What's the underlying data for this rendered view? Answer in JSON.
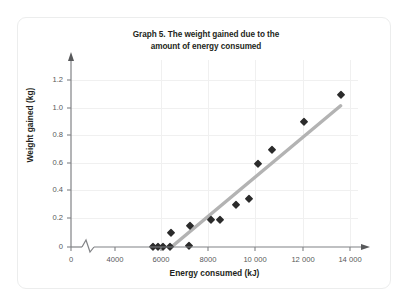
{
  "card": {
    "name": "chart-card"
  },
  "chart_data": {
    "type": "scatter",
    "title": "Graph 5. The weight gained due to the amount of energy consumed",
    "title_line1": "Graph 5. The weight gained due to the",
    "title_line2": "amount of energy consumed",
    "xlabel": "Energy consumed (kJ)",
    "ylabel": "Weight gained (kg)",
    "xlim": [
      4000,
      14600
    ],
    "ylim": [
      0,
      1.3
    ],
    "x_axis_break": true,
    "x_axis_break_note": "zigzag break between 0 and 4000",
    "grid": true,
    "legend": "none",
    "xticks": [
      0,
      4000,
      6000,
      8000,
      10000,
      12000,
      14000
    ],
    "xtick_labels": [
      "0",
      "4000",
      "6000",
      "8000",
      "10 000",
      "12 000",
      "14 000"
    ],
    "yticks": [
      0,
      0.2,
      0.4,
      0.6,
      0.8,
      1.0,
      1.2
    ],
    "ytick_labels": [
      "0",
      "0.2",
      "0.4",
      "0.6",
      "0.8",
      "1.0",
      "1.2"
    ],
    "marker_shape": "diamond",
    "marker_color": "#2b2b2b",
    "points": [
      {
        "x": 5600,
        "y": 0.0
      },
      {
        "x": 5850,
        "y": 0.0
      },
      {
        "x": 6050,
        "y": 0.0
      },
      {
        "x": 6350,
        "y": 0.0
      },
      {
        "x": 6400,
        "y": 0.1
      },
      {
        "x": 7150,
        "y": 0.01
      },
      {
        "x": 7200,
        "y": 0.15
      },
      {
        "x": 8100,
        "y": 0.195
      },
      {
        "x": 8450,
        "y": 0.195
      },
      {
        "x": 9150,
        "y": 0.3
      },
      {
        "x": 9700,
        "y": 0.345
      },
      {
        "x": 10100,
        "y": 0.6
      },
      {
        "x": 10700,
        "y": 0.7
      },
      {
        "x": 12050,
        "y": 0.9
      },
      {
        "x": 13600,
        "y": 1.1
      }
    ],
    "trendline": {
      "name": "line-of-best-fit",
      "color": "#b3b3b3",
      "x1": 6400,
      "y1": 0.0,
      "x2": 13600,
      "y2": 1.02
    }
  }
}
